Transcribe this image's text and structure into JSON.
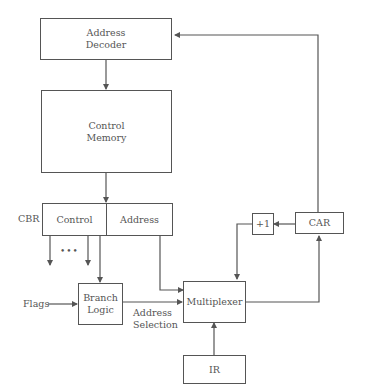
{
  "diagram": {
    "type": "microprogrammed control unit block diagram",
    "blocks": {
      "address_decoder": [
        "Address",
        "Decoder"
      ],
      "control_memory": [
        "Control",
        "Memory"
      ],
      "cbr_control": "Control",
      "cbr_address": "Address",
      "increment": "+1",
      "car": "CAR",
      "branch_logic": [
        "Branch",
        "Logic"
      ],
      "multiplexer": "Multiplexer",
      "ir": "IR"
    },
    "labels": {
      "cbr": "CBR",
      "flags": "Flags",
      "address_selection": [
        "Address",
        "Selection"
      ],
      "ellipsis": "•••"
    },
    "connections": [
      {
        "from": "Address Decoder",
        "to": "Control Memory"
      },
      {
        "from": "Control Memory",
        "to": "CBR"
      },
      {
        "from": "CBR Control",
        "to": "control outputs"
      },
      {
        "from": "CBR Control",
        "to": "Branch Logic"
      },
      {
        "from": "CBR Address",
        "to": "Multiplexer"
      },
      {
        "from": "Flags",
        "to": "Branch Logic"
      },
      {
        "from": "Branch Logic",
        "to": "Multiplexer",
        "label": "Address Selection"
      },
      {
        "from": "IR",
        "to": "Multiplexer"
      },
      {
        "from": "Multiplexer",
        "to": "CAR"
      },
      {
        "from": "CAR",
        "to": "+1"
      },
      {
        "from": "+1",
        "to": "Multiplexer"
      },
      {
        "from": "CAR",
        "to": "Address Decoder"
      }
    ]
  }
}
